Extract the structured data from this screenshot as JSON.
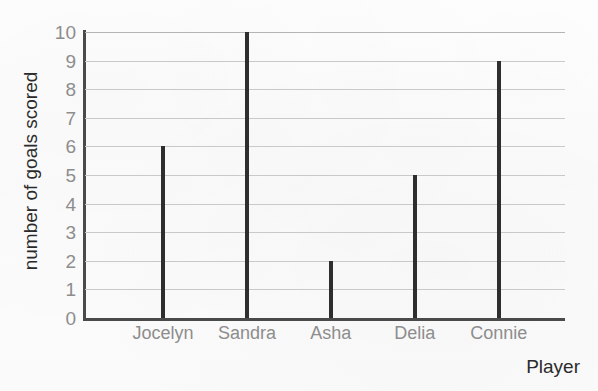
{
  "chart_data": {
    "type": "bar",
    "title": "",
    "categories": [
      "Jocelyn",
      "Sandra",
      "Asha",
      "Delia",
      "Connie"
    ],
    "values": [
      6,
      10,
      2,
      5,
      9
    ],
    "xlabel": "Player",
    "ylabel": "number of goals scored",
    "ylim": [
      0,
      10
    ],
    "ytick_labels": [
      "0",
      "1",
      "2",
      "3",
      "4",
      "5",
      "6",
      "7",
      "8",
      "9",
      "10"
    ],
    "ytick_values": [
      0,
      1,
      2,
      3,
      4,
      5,
      6,
      7,
      8,
      9,
      10
    ],
    "grid": true,
    "grid_axis": "y",
    "legend": null,
    "colors": {
      "bar": "#2e2e2e",
      "gridline": "#c9c9c9",
      "axis": "#4a4a4a",
      "tick_label": "#8d8d8d",
      "axis_title": "#2b2b2b",
      "background": "#fdfdfd"
    }
  }
}
